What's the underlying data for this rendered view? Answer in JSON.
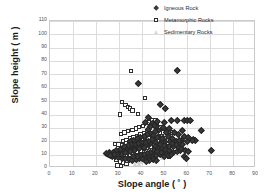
{
  "chart_data": {
    "type": "scatter",
    "title": "",
    "xlabel": "Slope angle ( ˚ )",
    "ylabel": "Slope height ( m )",
    "xlim": [
      0,
      90
    ],
    "ylim": [
      0,
      110
    ],
    "xticks": [
      0,
      10,
      20,
      30,
      40,
      50,
      60,
      70,
      80,
      90
    ],
    "yticks": [
      0,
      10,
      20,
      30,
      40,
      50,
      60,
      70,
      80,
      90,
      100,
      110
    ],
    "grid": true,
    "legend_position": "top-right",
    "series": [
      {
        "name": "Igneous Rock",
        "marker": "filled-diamond",
        "color": "#3a3a3a",
        "points": [
          [
            55.5,
            73.0
          ],
          [
            38.5,
            63.5
          ],
          [
            48.0,
            47.5
          ],
          [
            50.5,
            44.5
          ],
          [
            53.0,
            36.0
          ],
          [
            55.5,
            35.5
          ],
          [
            58.5,
            35.5
          ],
          [
            60.0,
            35.5
          ],
          [
            61.5,
            35.5
          ],
          [
            47.0,
            35.0
          ],
          [
            50.0,
            34.0
          ],
          [
            44.5,
            33.5
          ],
          [
            66.0,
            28.5
          ],
          [
            58.0,
            28.0
          ],
          [
            46.5,
            31.5
          ],
          [
            49.5,
            30.5
          ],
          [
            52.0,
            29.5
          ],
          [
            43.0,
            38.0
          ],
          [
            41.5,
            34.5
          ],
          [
            45.5,
            32.0
          ],
          [
            47.5,
            28.5
          ],
          [
            51.0,
            27.0
          ],
          [
            54.5,
            26.5
          ],
          [
            56.0,
            25.0
          ],
          [
            58.5,
            24.0
          ],
          [
            60.5,
            23.0
          ],
          [
            62.5,
            21.5
          ],
          [
            63.5,
            21.0
          ],
          [
            70.5,
            13.0
          ],
          [
            57.5,
            20.5
          ],
          [
            55.0,
            20.0
          ],
          [
            52.5,
            20.0
          ],
          [
            50.0,
            19.5
          ],
          [
            48.5,
            19.0
          ],
          [
            46.0,
            19.0
          ],
          [
            44.0,
            18.5
          ],
          [
            42.0,
            18.0
          ],
          [
            40.0,
            17.5
          ],
          [
            38.0,
            17.0
          ],
          [
            36.5,
            16.5
          ],
          [
            35.0,
            16.0
          ],
          [
            33.5,
            15.5
          ],
          [
            32.0,
            15.0
          ],
          [
            30.5,
            14.0
          ],
          [
            29.0,
            13.0
          ],
          [
            27.5,
            12.0
          ],
          [
            26.0,
            11.5
          ],
          [
            24.5,
            11.0
          ],
          [
            25.5,
            10.0
          ],
          [
            27.0,
            9.0
          ],
          [
            28.5,
            8.5
          ],
          [
            30.0,
            8.0
          ],
          [
            31.5,
            7.5
          ],
          [
            33.0,
            7.0
          ],
          [
            34.5,
            6.5
          ],
          [
            36.0,
            6.0
          ],
          [
            37.5,
            6.5
          ],
          [
            39.0,
            7.0
          ],
          [
            40.5,
            7.5
          ],
          [
            42.0,
            8.0
          ],
          [
            43.5,
            8.5
          ],
          [
            45.0,
            9.0
          ],
          [
            46.5,
            9.5
          ],
          [
            48.0,
            10.0
          ],
          [
            49.5,
            10.5
          ],
          [
            51.0,
            11.0
          ],
          [
            52.5,
            11.5
          ],
          [
            54.0,
            12.0
          ],
          [
            55.5,
            12.5
          ],
          [
            57.0,
            13.0
          ],
          [
            58.5,
            8.5
          ],
          [
            59.5,
            7.0
          ],
          [
            44.0,
            26.0
          ],
          [
            42.5,
            25.0
          ],
          [
            41.0,
            24.0
          ],
          [
            39.5,
            23.0
          ],
          [
            38.0,
            22.0
          ],
          [
            36.5,
            21.0
          ],
          [
            35.0,
            20.0
          ],
          [
            43.0,
            29.0
          ],
          [
            45.0,
            24.5
          ],
          [
            47.0,
            23.0
          ],
          [
            49.0,
            22.0
          ],
          [
            51.5,
            23.5
          ],
          [
            53.5,
            22.5
          ],
          [
            44.5,
            21.5
          ],
          [
            46.0,
            16.0
          ],
          [
            47.5,
            15.0
          ],
          [
            49.0,
            14.5
          ],
          [
            50.5,
            14.0
          ],
          [
            52.0,
            13.5
          ],
          [
            41.0,
            15.5
          ],
          [
            39.0,
            14.5
          ],
          [
            37.0,
            13.5
          ],
          [
            35.0,
            12.5
          ],
          [
            33.0,
            11.5
          ],
          [
            31.0,
            10.5
          ],
          [
            45.5,
            13.0
          ],
          [
            44.0,
            12.0
          ],
          [
            42.5,
            11.0
          ],
          [
            41.0,
            10.0
          ],
          [
            39.5,
            9.5
          ],
          [
            38.0,
            9.0
          ],
          [
            36.5,
            8.5
          ],
          [
            48.0,
            18.0
          ],
          [
            50.0,
            17.0
          ],
          [
            52.0,
            16.5
          ],
          [
            54.0,
            16.0
          ],
          [
            56.0,
            15.5
          ],
          [
            57.5,
            14.5
          ],
          [
            59.0,
            13.5
          ],
          [
            60.5,
            12.5
          ],
          [
            62.0,
            21.0
          ],
          [
            60.0,
            20.0
          ],
          [
            44.0,
            31.0
          ],
          [
            46.0,
            27.5
          ],
          [
            43.0,
            20.0
          ],
          [
            41.5,
            19.5
          ],
          [
            40.0,
            19.0
          ],
          [
            38.5,
            18.5
          ],
          [
            37.0,
            18.0
          ],
          [
            35.5,
            17.5
          ],
          [
            34.0,
            17.0
          ],
          [
            32.5,
            16.5
          ],
          [
            47.0,
            12.5
          ],
          [
            48.5,
            11.5
          ],
          [
            50.0,
            8.5
          ],
          [
            51.5,
            9.5
          ],
          [
            53.0,
            10.0
          ],
          [
            29.5,
            10.5
          ],
          [
            28.0,
            10.0
          ],
          [
            26.5,
            9.5
          ],
          [
            45.0,
            6.5
          ],
          [
            46.5,
            6.0
          ],
          [
            43.5,
            5.5
          ],
          [
            42.0,
            5.0
          ],
          [
            55.0,
            17.5
          ],
          [
            53.5,
            18.5
          ],
          [
            56.5,
            20.5
          ],
          [
            58.0,
            18.0
          ]
        ]
      },
      {
        "name": "Metamorphic Rocks",
        "marker": "open-square",
        "color": "#2e2e2e",
        "points": [
          [
            35.5,
            72.5
          ],
          [
            31.5,
            49.5
          ],
          [
            41.5,
            52.5
          ],
          [
            30.5,
            40.0
          ],
          [
            33.0,
            47.0
          ],
          [
            34.0,
            45.5
          ],
          [
            35.0,
            44.5
          ],
          [
            36.0,
            43.0
          ],
          [
            38.5,
            40.5
          ],
          [
            28.5,
            18.0
          ],
          [
            30.0,
            17.5
          ],
          [
            31.0,
            25.5
          ],
          [
            32.5,
            26.5
          ],
          [
            34.0,
            27.5
          ],
          [
            36.0,
            28.5
          ],
          [
            37.5,
            29.5
          ],
          [
            39.0,
            30.5
          ],
          [
            40.5,
            31.5
          ],
          [
            42.0,
            33.5
          ],
          [
            43.5,
            34.0
          ],
          [
            45.0,
            33.0
          ],
          [
            46.5,
            32.0
          ],
          [
            48.0,
            30.5
          ],
          [
            49.5,
            29.0
          ],
          [
            51.0,
            27.5
          ],
          [
            52.5,
            27.0
          ],
          [
            53.5,
            26.5
          ],
          [
            32.0,
            20.0
          ],
          [
            33.5,
            21.0
          ],
          [
            35.0,
            22.0
          ],
          [
            36.5,
            23.0
          ],
          [
            38.0,
            24.0
          ],
          [
            39.5,
            25.0
          ],
          [
            41.0,
            26.0
          ],
          [
            42.5,
            27.0
          ],
          [
            44.0,
            26.0
          ],
          [
            45.5,
            24.5
          ],
          [
            47.0,
            23.0
          ],
          [
            48.5,
            21.5
          ],
          [
            50.0,
            20.0
          ],
          [
            51.5,
            18.5
          ],
          [
            53.0,
            17.0
          ],
          [
            30.5,
            12.5
          ],
          [
            32.0,
            13.5
          ],
          [
            33.5,
            14.5
          ],
          [
            35.0,
            15.5
          ],
          [
            36.5,
            16.5
          ],
          [
            38.0,
            17.5
          ],
          [
            39.5,
            18.5
          ],
          [
            41.0,
            19.5
          ],
          [
            42.5,
            20.5
          ],
          [
            44.0,
            21.5
          ],
          [
            45.5,
            19.5
          ],
          [
            47.0,
            18.0
          ],
          [
            48.5,
            16.5
          ],
          [
            50.0,
            15.0
          ],
          [
            29.0,
            6.0
          ],
          [
            30.5,
            5.0
          ],
          [
            32.0,
            4.0
          ],
          [
            33.5,
            3.0
          ],
          [
            29.5,
            2.0
          ],
          [
            31.0,
            1.5
          ],
          [
            35.0,
            10.0
          ],
          [
            36.5,
            11.0
          ],
          [
            38.0,
            12.0
          ],
          [
            39.5,
            13.0
          ],
          [
            41.0,
            14.0
          ],
          [
            42.5,
            15.0
          ],
          [
            44.0,
            16.0
          ],
          [
            45.5,
            14.0
          ],
          [
            47.0,
            13.0
          ],
          [
            52.0,
            8.5
          ],
          [
            33.0,
            8.5
          ],
          [
            34.5,
            7.5
          ],
          [
            36.0,
            6.5
          ],
          [
            37.5,
            7.0
          ],
          [
            39.0,
            8.0
          ],
          [
            40.5,
            9.0
          ],
          [
            42.0,
            10.0
          ],
          [
            43.5,
            11.0
          ],
          [
            46.0,
            35.5
          ],
          [
            44.5,
            36.0
          ],
          [
            43.0,
            22.5
          ],
          [
            40.0,
            22.0
          ],
          [
            37.0,
            20.5
          ],
          [
            34.5,
            19.0
          ],
          [
            31.5,
            17.0
          ],
          [
            29.0,
            11.0
          ],
          [
            48.0,
            26.0
          ],
          [
            49.0,
            24.0
          ],
          [
            50.5,
            22.5
          ],
          [
            51.5,
            21.0
          ]
        ]
      },
      {
        "name": "Sedimentary Rocks",
        "marker": "open-triangle",
        "color": "#d3d3d3",
        "points": [
          [
            44.5,
            33.5
          ],
          [
            43.0,
            30.0
          ],
          [
            42.0,
            27.0
          ],
          [
            41.0,
            24.5
          ],
          [
            40.0,
            22.0
          ],
          [
            39.0,
            19.5
          ],
          [
            38.0,
            17.0
          ],
          [
            37.0,
            14.5
          ],
          [
            36.0,
            12.0
          ],
          [
            35.0,
            10.0
          ],
          [
            34.0,
            8.0
          ],
          [
            33.0,
            6.0
          ],
          [
            32.0,
            4.5
          ],
          [
            31.0,
            3.0
          ],
          [
            30.5,
            1.5
          ],
          [
            45.5,
            30.0
          ],
          [
            46.5,
            26.0
          ],
          [
            47.5,
            22.0
          ],
          [
            48.5,
            18.0
          ],
          [
            49.5,
            14.0
          ],
          [
            50.5,
            10.5
          ],
          [
            45.0,
            21.0
          ],
          [
            44.0,
            18.0
          ],
          [
            43.5,
            15.0
          ],
          [
            42.5,
            12.0
          ],
          [
            41.5,
            9.0
          ],
          [
            40.5,
            7.0
          ],
          [
            39.5,
            5.5
          ],
          [
            38.5,
            4.0
          ],
          [
            37.5,
            3.0
          ],
          [
            36.5,
            8.5
          ],
          [
            35.5,
            6.5
          ],
          [
            34.5,
            5.0
          ],
          [
            33.5,
            4.0
          ],
          [
            32.5,
            2.5
          ],
          [
            46.0,
            16.0
          ],
          [
            47.0,
            12.5
          ],
          [
            48.0,
            9.5
          ],
          [
            49.0,
            7.0
          ],
          [
            43.0,
            8.0
          ],
          [
            42.0,
            6.5
          ],
          [
            41.0,
            5.0
          ],
          [
            40.0,
            4.0
          ],
          [
            39.0,
            3.0
          ],
          [
            29.5,
            9.5
          ],
          [
            28.5,
            8.0
          ],
          [
            31.5,
            11.0
          ],
          [
            30.0,
            7.0
          ],
          [
            44.0,
            11.0
          ],
          [
            45.0,
            9.0
          ],
          [
            38.0,
            11.0
          ],
          [
            37.0,
            9.5
          ]
        ]
      }
    ]
  },
  "legend": {
    "items": [
      {
        "label": "Igneous Rock",
        "marker": "filled-diamond"
      },
      {
        "label": "Metamorphic Rocks",
        "marker": "open-square"
      },
      {
        "label": "Sedimentary Rocks",
        "marker": "open-triangle"
      }
    ]
  }
}
